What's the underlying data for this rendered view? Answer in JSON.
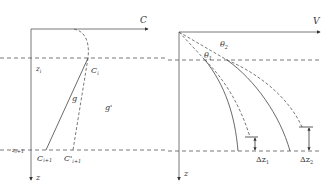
{
  "colors": {
    "line": "#333333",
    "background": "#ffffff"
  },
  "left_panel": {
    "x_axis_label": "C",
    "z_axis_label": "z",
    "zi_label": "z",
    "zi_sub": "i",
    "zi1_label": "z",
    "zi1_sub": "i+1",
    "ci_label": "C",
    "ci_sub": "i",
    "ci1_label": "C",
    "ci1_sub": "i+1",
    "cpi1_label": "C'",
    "cpi1_sub": "i+1",
    "g_label": "g",
    "gp_label": "g'"
  },
  "right_panel": {
    "x_axis_label": "V",
    "z_axis_label": "z",
    "theta1_label": "θ",
    "theta1_sub": "1",
    "theta2_label": "θ",
    "theta2_sub": "2",
    "dz1_label": "Δz",
    "dz1_sub": "1",
    "dz2_label": "Δz",
    "dz2_sub": "2"
  }
}
